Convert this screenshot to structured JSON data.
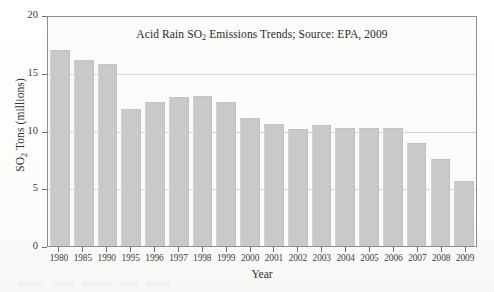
{
  "figure": {
    "background_color": "#fdfdfd",
    "plot_background_color": "#fbfbfa",
    "bar_color": "#c9c9c7",
    "axis_color": "#8e8e92",
    "grid_color": "#d6d6d4"
  },
  "chart_data": {
    "type": "bar",
    "title": "Acid Rain SO2 Emissions Trends; Source: EPA, 2009",
    "title_parts": {
      "before": "Acid Rain SO",
      "subscript": "2",
      "after": " Emissions Trends; Source: EPA, 2009"
    },
    "xlabel": "Year",
    "ylabel": "SO2 Tons (millions)",
    "ylabel_parts": {
      "before": "SO",
      "subscript": "2",
      "after": " Tons (millions)"
    },
    "categories": [
      "1980",
      "1985",
      "1990",
      "1995",
      "1996",
      "1997",
      "1998",
      "1999",
      "2000",
      "2001",
      "2002",
      "2003",
      "2004",
      "2005",
      "2006",
      "2007",
      "2008",
      "2009"
    ],
    "values": [
      17.0,
      16.1,
      15.8,
      11.9,
      12.5,
      12.9,
      13.0,
      12.5,
      11.1,
      10.6,
      10.1,
      10.5,
      10.2,
      10.2,
      10.2,
      8.9,
      7.5,
      5.6
    ],
    "ylim": [
      0,
      20
    ],
    "yticks": [
      0,
      5,
      10,
      15,
      20
    ],
    "ytick_labels": [
      "0",
      "5",
      "10",
      "15",
      "20"
    ],
    "grid": true,
    "grid_axis": "y",
    "legend": null
  }
}
